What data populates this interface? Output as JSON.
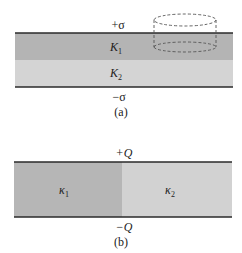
{
  "figure_a": {
    "top_charge": "+σ",
    "bottom_charge": "−σ",
    "layer_top_symbol": "K",
    "layer_top_sub": "1",
    "layer_bottom_symbol": "K",
    "layer_bottom_sub": "2",
    "caption": "(a)",
    "gaussian_surface": "cylinder"
  },
  "figure_b": {
    "top_charge": "+Q",
    "bottom_charge": "−Q",
    "left_symbol": "κ",
    "left_sub": "1",
    "right_symbol": "κ",
    "right_sub": "2",
    "caption": "(b)"
  },
  "colors": {
    "plate": "#2a2a2a",
    "dielectric_dark": "#b4b4b4",
    "dielectric_light": "#d2d2d2",
    "dashed": "#555555"
  }
}
